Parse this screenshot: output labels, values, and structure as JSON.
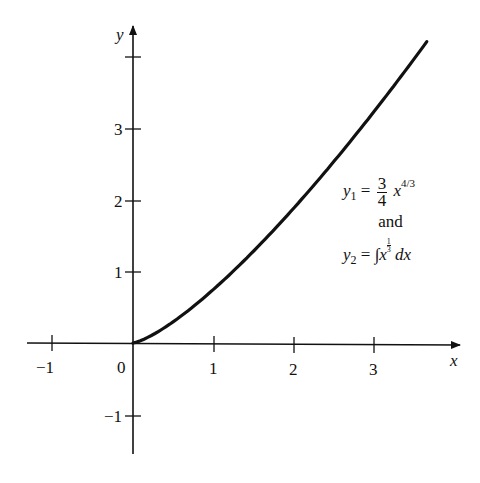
{
  "chart_data": {
    "type": "line",
    "title": "",
    "xlabel": "x",
    "ylabel": "y",
    "xlim": [
      -1.3,
      4.1
    ],
    "ylim": [
      -1.5,
      4.3
    ],
    "grid": false,
    "x_ticks": [
      -1,
      0,
      1,
      2,
      3
    ],
    "x_tick_labels": [
      "−1",
      "0",
      "1",
      "2",
      "3"
    ],
    "y_ticks": [
      -1,
      1,
      2,
      3,
      4
    ],
    "y_tick_labels": [
      "−1",
      "1",
      "2",
      "3",
      ""
    ],
    "series": [
      {
        "name": "y1 = (3/4) x^(4/3)",
        "x": [
          0,
          0.25,
          0.5,
          1,
          1.5,
          2,
          2.5,
          3,
          3.5,
          3.65
        ],
        "values": [
          0,
          0.119,
          0.298,
          0.75,
          1.288,
          1.89,
          2.544,
          3.245,
          3.987,
          4.218
        ]
      }
    ],
    "annotations": [
      {
        "text": "y1 = 3/4 x^(4/3)"
      },
      {
        "text": "and"
      },
      {
        "text": "y2 = ∫x^(1/3) dx"
      }
    ]
  },
  "labels": {
    "x_axis": "x",
    "y_axis": "y",
    "origin": "0",
    "xticks": [
      "−1",
      "1",
      "2",
      "3"
    ],
    "yticks": [
      "1",
      "2",
      "3",
      "−1"
    ]
  },
  "legend": {
    "y1_var": "y",
    "y1_sub": "1",
    "eq": "=",
    "frac_num": "3",
    "frac_den": "4",
    "x_var": "x",
    "y1_exp": "4/3",
    "and": "and",
    "y2_var": "y",
    "y2_sub": "2",
    "integral": "∫",
    "y2_exp_num": "1",
    "y2_exp_den": "3",
    "dx": "dx"
  },
  "colors": {
    "axis": "#111111",
    "curve": "#111111",
    "background": "#ffffff"
  }
}
